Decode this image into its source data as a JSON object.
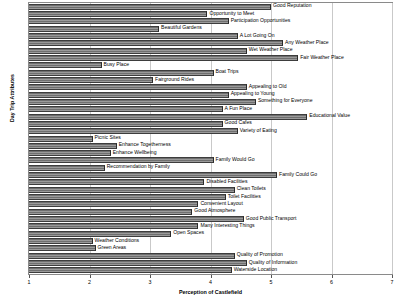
{
  "chart_data": {
    "type": "bar",
    "orientation": "horizontal",
    "title": "",
    "xlabel": "Perception of Castlefield",
    "ylabel": "Day Trip Attributes",
    "xlim": [
      1,
      7
    ],
    "xticks": [
      1,
      2,
      3,
      4,
      5,
      6,
      7
    ],
    "xtick_labels": [
      "1",
      "2",
      "3",
      "4",
      "5",
      "6",
      "7"
    ],
    "grid": true,
    "legend": false,
    "bar_color": "#7f7f7f",
    "categories": [
      "Good Reputation",
      "Opportunity to Meet",
      "Participation Opportunities",
      "Beautiful Gardens",
      "A Lot Going On",
      "Any Weather Place",
      "Wet Weather Place",
      "Fair Weather Place",
      "Busy Place",
      "Boat Trips",
      "Fairground Rides",
      "Appealing to Old",
      "Appealing to Young",
      "Something for Everyone",
      "A Fun Place",
      "Educational Value",
      "Good Cafes",
      "Variety of Eating",
      "Picnic Sites",
      "Enhance Togetherness",
      "Enhance Wellbeing",
      "Family Would Go",
      "Recommendation by Family",
      "Family Could Go",
      "Disabled Facilities",
      "Clean Toilets",
      "Toilet Facilities",
      "Convenient Layout",
      "Good Atmosphere",
      "Good Public Transport",
      "Many Interesting Things",
      "Open Spaces",
      "Weather Conditions",
      "Green Areas",
      "Quality of Promotion",
      "Quality of Information",
      "Waterside Location"
    ],
    "values": [
      5.0,
      3.95,
      4.3,
      3.15,
      4.45,
      5.2,
      4.6,
      5.45,
      2.2,
      4.05,
      3.05,
      4.6,
      4.3,
      4.75,
      4.2,
      5.6,
      4.2,
      4.45,
      2.05,
      2.45,
      2.35,
      4.05,
      2.25,
      5.1,
      3.9,
      4.4,
      4.25,
      3.8,
      3.7,
      4.55,
      3.8,
      3.35,
      2.05,
      2.1,
      4.4,
      4.6,
      4.35
    ]
  }
}
